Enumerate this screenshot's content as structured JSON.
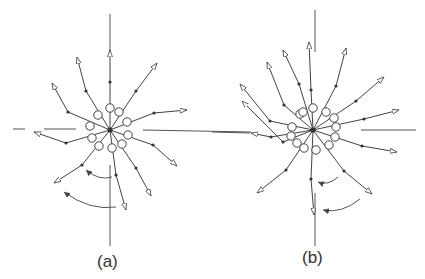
{
  "figure": {
    "panels": [
      {
        "id": "a",
        "label": "(a)",
        "center": [
          110,
          130
        ],
        "rays": [
          {
            "end": [
              110,
              50
            ],
            "mid": [
              110,
              82
            ],
            "ring": [
              110,
              108
            ]
          },
          {
            "end": [
              157,
              63
            ],
            "mid": [
              136,
              91
            ],
            "ring": [
              119,
              112
            ]
          },
          {
            "end": [
              187,
              110
            ],
            "mid": [
              154,
              113
            ],
            "ring": [
              127,
              122
            ]
          },
          {
            "end": [
              177,
              166
            ],
            "mid": [
              153,
              145
            ],
            "ring": [
              128,
              135
            ]
          },
          {
            "end": [
              151,
              196
            ],
            "mid": [
              136,
              168
            ],
            "ring": [
              122,
              144
            ]
          },
          {
            "end": [
              126,
              210
            ],
            "mid": [
              116,
              175
            ],
            "ring": [
              112,
              148
            ]
          },
          {
            "end": [
              54,
              183
            ],
            "mid": [
              82,
              165
            ],
            "ring": [
              99,
              146
            ]
          },
          {
            "end": [
              34,
              132
            ],
            "mid": [
              66,
              143
            ],
            "ring": [
              92,
              138
            ]
          },
          {
            "end": [
              52,
              83
            ],
            "mid": [
              68,
              112
            ],
            "ring": [
              90,
              126
            ]
          },
          {
            "end": [
              77,
              57
            ],
            "mid": [
              86,
              91
            ],
            "ring": [
              98,
              115
            ]
          }
        ],
        "curved_arrows": [
          {
            "from": [
              112,
              177
            ],
            "to": [
              86,
              170
            ]
          },
          {
            "from": [
              116,
              207
            ],
            "to": [
              64,
              192
            ]
          }
        ]
      },
      {
        "id": "b",
        "label": "(b)",
        "center": [
          313,
          130
        ],
        "rays": [
          {
            "end": [
              309,
              42
            ],
            "mid": [
              311,
              90
            ],
            "ring": [
              313,
              108
            ]
          },
          {
            "end": [
              346,
              48
            ],
            "mid": [
              336,
              86
            ],
            "ring": [
              326,
              112
            ]
          },
          {
            "end": [
              384,
              77
            ],
            "mid": [
              356,
              101
            ],
            "ring": [
              334,
              118
            ]
          },
          {
            "end": [
              399,
              110
            ],
            "mid": [
              364,
              119
            ],
            "ring": [
              336,
              127
            ]
          },
          {
            "end": [
              397,
              152
            ],
            "mid": [
              362,
              146
            ],
            "ring": [
              335,
              137
            ]
          },
          {
            "end": [
              372,
              194
            ],
            "mid": [
              344,
              171
            ],
            "ring": [
              329,
              145
            ]
          },
          {
            "end": [
              314,
              215
            ],
            "mid": [
              311,
              179
            ],
            "ring": [
              316,
              150
            ]
          },
          {
            "end": [
              257,
              193
            ],
            "mid": [
              286,
              170
            ],
            "ring": [
              304,
              148
            ]
          },
          {
            "end": [
              242,
              101
            ],
            "mid": [
              283,
              142
            ],
            "ring": [
              297,
              143
            ]
          },
          {
            "end": [
              251,
              133
            ],
            "mid": [
              271,
              137
            ],
            "ring": [
              291,
              136
            ]
          },
          {
            "end": [
              240,
              84
            ],
            "mid": [
              270,
              121
            ],
            "ring": [
              292,
              127
            ]
          },
          {
            "end": [
              267,
              62
            ],
            "mid": [
              284,
              105
            ],
            "ring": [
              300,
              114
            ]
          },
          {
            "end": [
              283,
              50
            ],
            "mid": [
              299,
              84
            ],
            "ring": [
              303,
              112
            ]
          }
        ],
        "curved_arrows": [
          {
            "from": [
              338,
              177
            ],
            "to": [
              318,
              182
            ]
          },
          {
            "from": [
              360,
              199
            ],
            "to": [
              323,
              210
            ]
          }
        ]
      }
    ]
  }
}
